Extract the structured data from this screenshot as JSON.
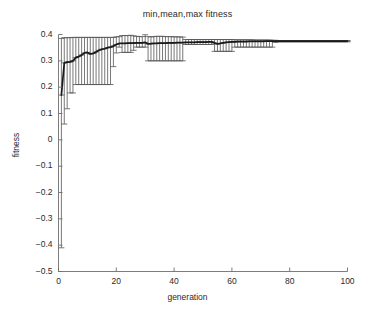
{
  "chart_data": {
    "type": "line",
    "title": "min,mean,max fitness",
    "xlabel": "generation",
    "ylabel": "fitness",
    "xlim": [
      0,
      100
    ],
    "ylim": [
      -0.5,
      0.4
    ],
    "xticks": [
      0,
      20,
      40,
      60,
      80,
      100
    ],
    "xtick_labels": [
      "0",
      "20",
      "40",
      "60",
      "80",
      "100"
    ],
    "yticks": [
      0.4,
      0.3,
      0.2,
      0.1,
      0,
      -0.1,
      -0.2,
      -0.3,
      -0.4,
      -0.5
    ],
    "ytick_labels": [
      "0.4",
      "0.3",
      "0.2",
      "0.1",
      "0",
      "-0.1",
      "-0.2",
      "-0.3",
      "-0.4",
      "-0.5"
    ],
    "grid": false,
    "legend": null,
    "line_color": "#1a1a1a",
    "errorbar_color": "#555555",
    "marker": "plus-cap",
    "x": [
      1,
      2,
      3,
      4,
      5,
      6,
      7,
      8,
      9,
      10,
      11,
      12,
      13,
      14,
      15,
      16,
      17,
      18,
      19,
      20,
      21,
      22,
      23,
      24,
      25,
      26,
      27,
      28,
      29,
      30,
      31,
      32,
      33,
      34,
      35,
      36,
      37,
      38,
      39,
      40,
      41,
      42,
      43,
      44,
      45,
      46,
      47,
      48,
      49,
      50,
      51,
      52,
      53,
      54,
      55,
      56,
      57,
      58,
      59,
      60,
      61,
      62,
      63,
      64,
      65,
      66,
      67,
      68,
      69,
      70,
      71,
      72,
      73,
      74,
      75,
      76,
      77,
      78,
      79,
      80,
      81,
      82,
      83,
      84,
      85,
      86,
      87,
      88,
      89,
      90,
      91,
      92,
      93,
      94,
      95,
      96,
      97,
      98,
      99,
      100
    ],
    "series": [
      {
        "name": "mean",
        "values": [
          0.17,
          0.292,
          0.295,
          0.296,
          0.3,
          0.312,
          0.316,
          0.322,
          0.33,
          0.332,
          0.326,
          0.328,
          0.334,
          0.34,
          0.344,
          0.346,
          0.35,
          0.352,
          0.356,
          0.362,
          0.366,
          0.366,
          0.366,
          0.367,
          0.367,
          0.367,
          0.368,
          0.368,
          0.368,
          0.37,
          0.364,
          0.365,
          0.366,
          0.366,
          0.367,
          0.367,
          0.367,
          0.368,
          0.368,
          0.368,
          0.369,
          0.369,
          0.369,
          0.37,
          0.37,
          0.37,
          0.37,
          0.371,
          0.371,
          0.371,
          0.371,
          0.372,
          0.372,
          0.368,
          0.364,
          0.366,
          0.368,
          0.37,
          0.371,
          0.372,
          0.372,
          0.373,
          0.373,
          0.373,
          0.373,
          0.374,
          0.374,
          0.374,
          0.374,
          0.374,
          0.374,
          0.375,
          0.375,
          0.375,
          0.375,
          0.375,
          0.375,
          0.375,
          0.375,
          0.375,
          0.375,
          0.375,
          0.375,
          0.375,
          0.375,
          0.375,
          0.375,
          0.375,
          0.375,
          0.375,
          0.375,
          0.375,
          0.375,
          0.375,
          0.375,
          0.375,
          0.375,
          0.375,
          0.375,
          0.375
        ]
      },
      {
        "name": "max",
        "values": [
          0.385,
          0.388,
          0.388,
          0.388,
          0.389,
          0.389,
          0.389,
          0.389,
          0.389,
          0.389,
          0.389,
          0.389,
          0.389,
          0.389,
          0.389,
          0.389,
          0.389,
          0.389,
          0.389,
          0.391,
          0.392,
          0.396,
          0.396,
          0.396,
          0.397,
          0.395,
          0.393,
          0.392,
          0.392,
          0.399,
          0.392,
          0.391,
          0.392,
          0.393,
          0.393,
          0.393,
          0.392,
          0.392,
          0.392,
          0.391,
          0.391,
          0.391,
          0.39,
          0.381,
          0.381,
          0.381,
          0.381,
          0.381,
          0.381,
          0.381,
          0.381,
          0.381,
          0.381,
          0.381,
          0.381,
          0.381,
          0.381,
          0.381,
          0.381,
          0.381,
          0.38,
          0.38,
          0.38,
          0.38,
          0.38,
          0.38,
          0.38,
          0.379,
          0.379,
          0.379,
          0.379,
          0.379,
          0.379,
          0.378,
          0.378,
          0.377,
          0.377,
          0.377,
          0.377,
          0.377,
          0.377,
          0.377,
          0.377,
          0.377,
          0.377,
          0.377,
          0.377,
          0.377,
          0.377,
          0.377,
          0.377,
          0.377,
          0.377,
          0.377,
          0.377,
          0.377,
          0.377,
          0.377,
          0.377,
          0.377
        ]
      },
      {
        "name": "min",
        "values": [
          -0.41,
          0.06,
          0.118,
          0.178,
          0.178,
          0.21,
          0.21,
          0.21,
          0.21,
          0.21,
          0.21,
          0.21,
          0.21,
          0.21,
          0.21,
          0.21,
          0.21,
          0.21,
          0.278,
          0.33,
          0.352,
          0.332,
          0.332,
          0.332,
          0.332,
          0.34,
          0.352,
          0.352,
          0.352,
          0.352,
          0.3,
          0.3,
          0.3,
          0.3,
          0.3,
          0.3,
          0.3,
          0.3,
          0.3,
          0.3,
          0.3,
          0.3,
          0.3,
          0.362,
          0.362,
          0.362,
          0.362,
          0.362,
          0.362,
          0.362,
          0.362,
          0.362,
          0.362,
          0.336,
          0.336,
          0.336,
          0.336,
          0.336,
          0.336,
          0.336,
          0.352,
          0.352,
          0.352,
          0.352,
          0.352,
          0.352,
          0.352,
          0.352,
          0.352,
          0.352,
          0.352,
          0.352,
          0.352,
          0.352,
          0.37,
          0.372,
          0.372,
          0.372,
          0.372,
          0.372,
          0.372,
          0.372,
          0.372,
          0.372,
          0.372,
          0.372,
          0.372,
          0.372,
          0.372,
          0.372,
          0.372,
          0.372,
          0.372,
          0.372,
          0.372,
          0.372,
          0.372,
          0.372,
          0.372,
          0.372
        ]
      }
    ]
  },
  "axes": {
    "box_color": "#6e6e6e",
    "tick_color": "#6e6e6e"
  }
}
